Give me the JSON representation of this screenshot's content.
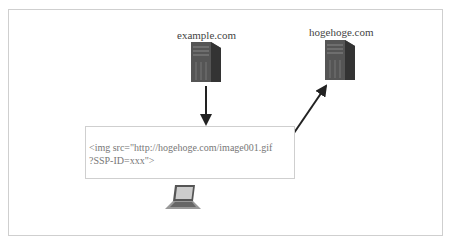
{
  "diagram": {
    "nodes": [
      {
        "id": "example",
        "label": "example.com",
        "icon": "server-icon"
      },
      {
        "id": "hogehoge",
        "label": "hogehoge.com",
        "icon": "server-icon"
      },
      {
        "id": "client",
        "label": "",
        "icon": "laptop-icon"
      }
    ],
    "code": {
      "line1": "<img src=\"http://hogehoge.com/image001.gif",
      "line2": "?SSP-ID=xxx\">"
    },
    "edges": [
      {
        "from": "example",
        "to": "code"
      },
      {
        "from": "code",
        "to": "hogehoge"
      }
    ]
  }
}
